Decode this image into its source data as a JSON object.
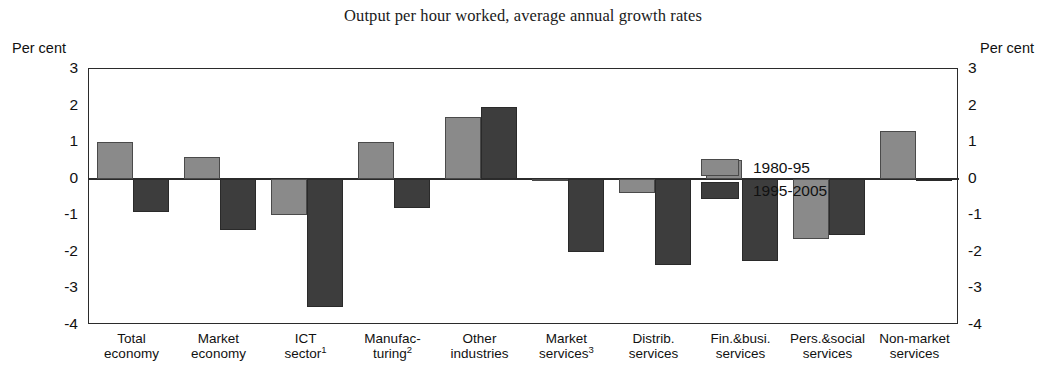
{
  "chart_data": {
    "type": "bar",
    "title": "Output per hour worked, average annual growth rates",
    "xlabel": "",
    "ylabel": "Per cent",
    "ylabel_right": "Per cent",
    "ylim": [
      -4,
      3
    ],
    "yticks": [
      "3",
      "2",
      "1",
      "0",
      "-1",
      "-2",
      "-3",
      "-4"
    ],
    "ytick_values": [
      3,
      2,
      1,
      0,
      -1,
      -2,
      -3,
      -4
    ],
    "grid": false,
    "legend_position": "inside-top-right",
    "categories": [
      "Total economy",
      "Market economy",
      "ICT sector",
      "Manufacturing",
      "Other industries",
      "Market services",
      "Distrib. services",
      "Fin.&busi. services",
      "Pers.&social services",
      "Non-market services"
    ],
    "category_labels": [
      {
        "line1": "Total",
        "line2": "economy",
        "sup": ""
      },
      {
        "line1": "Market",
        "line2": "economy",
        "sup": ""
      },
      {
        "line1": "ICT",
        "line2": "sector",
        "sup": "1"
      },
      {
        "line1": "Manufac-",
        "line2": "turing",
        "sup": "2"
      },
      {
        "line1": "Other",
        "line2": "industries",
        "sup": ""
      },
      {
        "line1": "Market",
        "line2": "services",
        "sup": "3"
      },
      {
        "line1": "Distrib.",
        "line2": "services",
        "sup": ""
      },
      {
        "line1": "Fin.&busi.",
        "line2": "services",
        "sup": ""
      },
      {
        "line1": "Pers.&social",
        "line2": "services",
        "sup": ""
      },
      {
        "line1": "Non-market",
        "line2": "services",
        "sup": ""
      }
    ],
    "series": [
      {
        "name": "1980-95",
        "color": "#8a8a8a",
        "values": [
          1.0,
          0.6,
          -1.0,
          1.0,
          1.7,
          -0.05,
          -0.4,
          0.5,
          -1.65,
          1.3
        ]
      },
      {
        "name": "1995-2005",
        "color": "#3d3d3d",
        "values": [
          -0.9,
          -1.4,
          -3.5,
          -0.8,
          1.95,
          -2.0,
          -2.35,
          -2.25,
          -1.55,
          -0.05
        ]
      }
    ]
  },
  "legend": {
    "entries": [
      {
        "label": "1980-95"
      },
      {
        "label": "1995-2005"
      }
    ]
  },
  "axis": {
    "left_caption": "Per cent",
    "right_caption": "Per cent"
  },
  "footnote": {
    "text": ""
  }
}
